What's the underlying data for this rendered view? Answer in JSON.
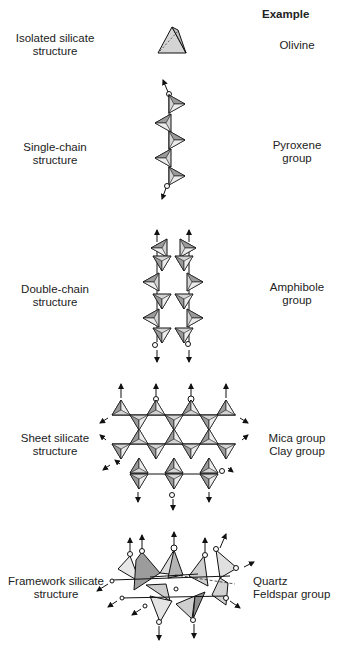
{
  "header": {
    "example_label": "Example"
  },
  "rows": [
    {
      "structure": [
        "Isolated silicate",
        "structure"
      ],
      "example": [
        "Olivine"
      ]
    },
    {
      "structure": [
        "Single-chain",
        "structure"
      ],
      "example": [
        "Pyroxene",
        "group"
      ]
    },
    {
      "structure": [
        "Double-chain",
        "structure"
      ],
      "example": [
        "Amphibole",
        "group"
      ]
    },
    {
      "structure": [
        "Sheet silicate",
        "structure"
      ],
      "example": [
        "Mica group",
        "Clay group"
      ]
    },
    {
      "structure": [
        "Framework silicate",
        "structure"
      ],
      "example": [
        "Quartz",
        "Feldspar group"
      ]
    }
  ],
  "colors": {
    "tetra_face": "#d4d4d4",
    "tetra_dark": "#9a9a9a",
    "line": "#111111"
  }
}
